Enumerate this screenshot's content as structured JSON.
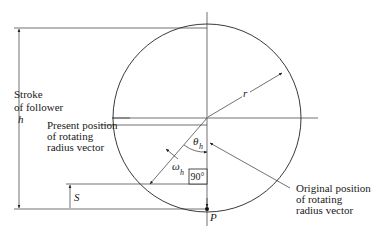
{
  "diagram": {
    "type": "cam-follower-displacement",
    "labels": {
      "stroke_line1": "Stroke",
      "stroke_line2": "of follower",
      "stroke_symbol": "h",
      "present_line1": "Present position",
      "present_line2": "of rotating",
      "present_line3": "radius vector",
      "original_line1": "Original position",
      "original_line2": "of rotating",
      "original_line3": "radius vector",
      "radius": "r",
      "theta": "θ",
      "theta_sub": "h",
      "omega": "ω",
      "omega_sub": "h",
      "right_angle": "90°",
      "displacement": "S",
      "point": "P"
    },
    "colors": {
      "line": "#222222",
      "text": "#1a1a1a",
      "background": "#ffffff"
    }
  }
}
